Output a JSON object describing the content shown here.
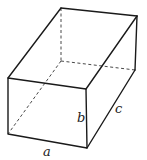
{
  "diagram": {
    "type": "rectangular-box-3d",
    "labels": {
      "a": "a",
      "b": "b",
      "c": "c"
    },
    "colors": {
      "background": "#ffffff",
      "line": "#1a1a1a"
    }
  }
}
